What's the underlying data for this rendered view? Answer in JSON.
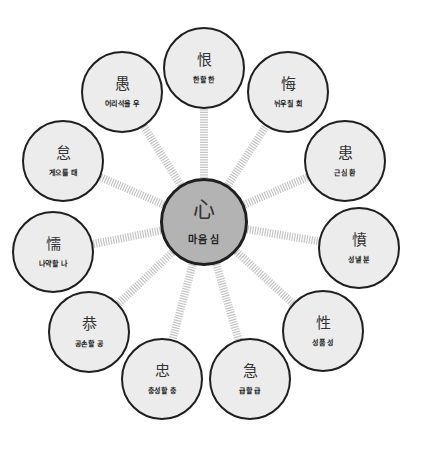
{
  "diagram": {
    "colors": {
      "outer_fill": "#ececec",
      "center_fill": "#b3b3b3",
      "stroke": "#1f1f1f",
      "connector": "#c4c4c4"
    },
    "center": {
      "hanja": "心",
      "meaning": "마음 심",
      "x": 204,
      "y": 222,
      "r": 44
    },
    "nodes": [
      {
        "hanja": "恨",
        "meaning": "한할 한",
        "x": 204,
        "y": 68
      },
      {
        "hanja": "悔",
        "meaning": "뉘우칠 회",
        "x": 288,
        "y": 92
      },
      {
        "hanja": "患",
        "meaning": "근심 환",
        "x": 345,
        "y": 161
      },
      {
        "hanja": "憤",
        "meaning": "성낼 분",
        "x": 359,
        "y": 248
      },
      {
        "hanja": "性",
        "meaning": "성품 성",
        "x": 323,
        "y": 331
      },
      {
        "hanja": "急",
        "meaning": "급할 급",
        "x": 250,
        "y": 379
      },
      {
        "hanja": "忠",
        "meaning": "충성할 충",
        "x": 162,
        "y": 379
      },
      {
        "hanja": "恭",
        "meaning": "공손할 공",
        "x": 89,
        "y": 332
      },
      {
        "hanja": "懦",
        "meaning": "나약할 나",
        "x": 53,
        "y": 252
      },
      {
        "hanja": "怠",
        "meaning": "게으를 태",
        "x": 63,
        "y": 161
      },
      {
        "hanja": "愚",
        "meaning": "어리석을 우",
        "x": 122,
        "y": 92
      }
    ],
    "node_radius": 41
  }
}
